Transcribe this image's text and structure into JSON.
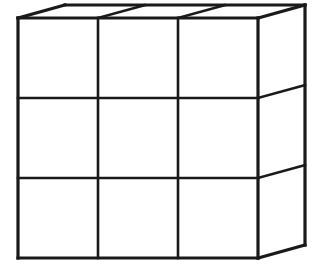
{
  "figure": {
    "title": "3x3 subdivided cube",
    "background_color": "#ffffff",
    "line_color": "#1a1a1a",
    "face_color": "#ffffff",
    "outer_stroke_width": 3.2,
    "inner_stroke_width": 2.6,
    "grid_rows": 3,
    "grid_columns": 3,
    "visible_faces": [
      "front",
      "top",
      "right"
    ],
    "front_face": {
      "left": 18,
      "top": 18,
      "right": 258,
      "bottom": 258,
      "x_lines": [
        18,
        98,
        178,
        258
      ],
      "y_lines": [
        18,
        98,
        178,
        258
      ]
    },
    "depth_offset": {
      "dx": 47,
      "dy": -13
    },
    "front_outline_points": "18,18 258,18 258,258 18,258",
    "top_face_points": "18,18 258,18 305,5 65,5",
    "right_face_points": "258,18 305,5 305,245 258,258",
    "front_vertical_lines": [
      {
        "name": "front-grid-vertical-1",
        "x1": 98,
        "y1": 18,
        "x2": 98,
        "y2": 258
      },
      {
        "name": "front-grid-vertical-2",
        "x1": 178,
        "y1": 18,
        "x2": 178,
        "y2": 258
      }
    ],
    "front_horizontal_lines": [
      {
        "name": "front-grid-horizontal-1",
        "x1": 18,
        "y1": 98,
        "x2": 258,
        "y2": 98
      },
      {
        "name": "front-grid-horizontal-2",
        "x1": 18,
        "y1": 178,
        "x2": 258,
        "y2": 178
      }
    ],
    "top_face_depth_lines": [
      {
        "name": "top-face-depth-line-1",
        "x1": 98,
        "y1": 18,
        "x2": 145,
        "y2": 5
      },
      {
        "name": "top-face-depth-line-2",
        "x1": 178,
        "y1": 18,
        "x2": 225,
        "y2": 5
      }
    ],
    "right_face_depth_lines": [
      {
        "name": "right-face-depth-line-1",
        "x1": 258,
        "y1": 98,
        "x2": 305,
        "y2": 85
      },
      {
        "name": "right-face-depth-line-2",
        "x1": 258,
        "y1": 178,
        "x2": 305,
        "y2": 165
      }
    ],
    "outer_edges": [
      {
        "name": "front-top-edge",
        "x1": 18,
        "y1": 18,
        "x2": 258,
        "y2": 18
      },
      {
        "name": "front-right-edge",
        "x1": 258,
        "y1": 18,
        "x2": 258,
        "y2": 258
      },
      {
        "name": "front-bottom-edge",
        "x1": 258,
        "y1": 258,
        "x2": 18,
        "y2": 258
      },
      {
        "name": "front-left-edge",
        "x1": 18,
        "y1": 258,
        "x2": 18,
        "y2": 18
      },
      {
        "name": "top-left-depth-edge",
        "x1": 18,
        "y1": 18,
        "x2": 65,
        "y2": 5
      },
      {
        "name": "back-top-edge",
        "x1": 65,
        "y1": 5,
        "x2": 305,
        "y2": 5
      },
      {
        "name": "top-right-depth-edge",
        "x1": 305,
        "y1": 5,
        "x2": 258,
        "y2": 18
      },
      {
        "name": "back-right-vertical-edge",
        "x1": 305,
        "y1": 5,
        "x2": 305,
        "y2": 245
      },
      {
        "name": "bottom-right-depth-edge",
        "x1": 305,
        "y1": 245,
        "x2": 258,
        "y2": 258
      }
    ],
    "cell_count_front": 9
  }
}
